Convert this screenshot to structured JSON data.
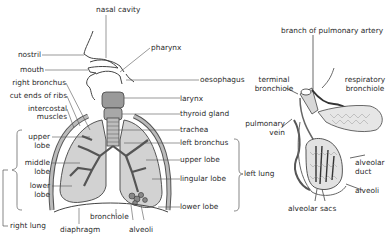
{
  "diagram": {
    "colors": {
      "tissue": "#c8c8c8",
      "lung": "#d3d3d3",
      "line": "#3a3a3a",
      "dark": "#555555"
    },
    "respiratory_system": {
      "labels": {
        "nasal_cavity": "nasal cavity",
        "nostril": "nostril",
        "pharynx": "pharynx",
        "mouth": "mouth",
        "oesophagus": "oesophagus",
        "right_bronchus": "right bronchus",
        "cut_ends_of_ribs": "cut ends of ribs",
        "larynx": "larynx",
        "intercostal_muscles_1": "intercostal",
        "intercostal_muscles_2": "muscles",
        "thyroid_gland": "thyroid gland",
        "trachea": "trachea",
        "left_bronchus": "left bronchus",
        "upper_lobe_r1": "upper",
        "upper_lobe_r2": "lobe",
        "middle_lobe_1": "middle",
        "middle_lobe_2": "lobe",
        "lower_lobe_r1": "lower",
        "lower_lobe_r2": "lobe",
        "upper_lobe_l": "upper lobe",
        "lingular_lobe": "lingular lobe",
        "lower_lobe_l": "lower lobe",
        "left_lung": "left lung",
        "right_lung": "right lung",
        "bronchiole": "bronchiole",
        "diaphragm": "diaphragm",
        "alveoli": "alveoli"
      }
    },
    "alveolus_detail": {
      "labels": {
        "branch_of_pulmonary_artery": "branch of pulmonary artery",
        "terminal_bronchiole_1": "terminal",
        "terminal_bronchiole_2": "bronchiole",
        "respiratory_bronchiole_1": "respiratory",
        "respiratory_bronchiole_2": "bronchiole",
        "pulmonary_vein_1": "pulmonary",
        "pulmonary_vein_2": "vein",
        "alveolar_duct_1": "alveolar",
        "alveolar_duct_2": "duct",
        "alveoli": "alveoli",
        "alveolar_sacs": "alveolar sacs"
      }
    }
  }
}
